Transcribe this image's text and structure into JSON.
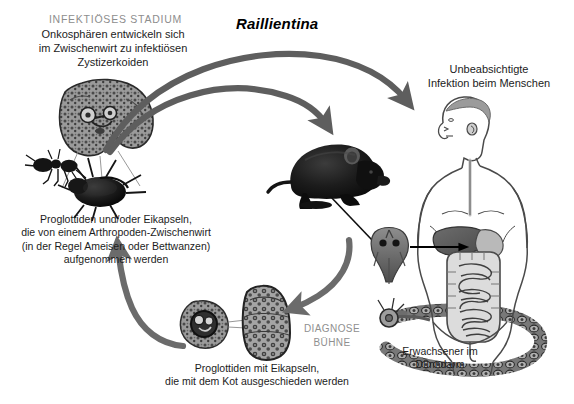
{
  "figure": {
    "title": "Raillientina",
    "domain_note": "parasite life cycle diagram"
  },
  "labels": {
    "infectious_stage_heading": "INFEKTIÖSES STADIUM",
    "infectious_stage_body": "Onkosphären entwickeln sich\nim Zwischenwirt zu infektiösen\nZystizerkoiden",
    "human_infection": "Unbeabsichtigte\nInfektion beim Menschen",
    "arthropod_host": "Proglottiden und/oder Eikapseln,\ndie von einem Arthropoden-Zwischenwirt\n(in der Regel Ameisen oder Bettwanzen)\naufgenommen werden",
    "diagnostic_stage": "DIAGNOSE\nBÜHNE",
    "adult_worm": "Erwachsener im\nDünndarm",
    "feces_stage": "Proglottiden mit Eikapseln,\ndie mit dem Kot ausgeschieden werden"
  },
  "artwork": {
    "cysticercoid": "cysticercoid-micrograph",
    "ant": "ant-illustration",
    "beetle": "beetle-bedbug-illustration",
    "rodent": "black-rat-illustration",
    "scolex": "tapeworm-scolex-detail",
    "human": "human-torso-digestive-tract",
    "egg_capsule": "egg-capsule-micrograph",
    "proglottid": "gravid-proglottid-micrograph",
    "adult_tapeworm": "adult-tapeworm-illustration"
  },
  "arrows": [
    {
      "name": "arthropod-to-rodent",
      "color": "#5e5e5e",
      "style": "thick-curved"
    },
    {
      "name": "arthropod-to-human",
      "color": "#5e5e5e",
      "style": "thick-curved"
    },
    {
      "name": "rodent-to-feces",
      "color": "#6b6b6b",
      "style": "thick-curved"
    },
    {
      "name": "feces-to-arthropod",
      "color": "#6b6b6b",
      "style": "thick-curved"
    },
    {
      "name": "scolex-to-human-intestine",
      "color": "#000000",
      "style": "thin-straight"
    },
    {
      "name": "rodent-to-scolex-leader",
      "color": "#000000",
      "style": "thin-leader"
    }
  ],
  "colors": {
    "background": "#ffffff",
    "arrow_gray": "#5e5e5e",
    "text_dark": "#1c1c1c",
    "text_gray": "#8d8d8d"
  }
}
